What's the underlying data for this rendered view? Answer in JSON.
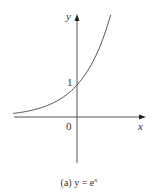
{
  "chart_data": {
    "type": "line",
    "function": "y = e^x",
    "xlabel": "x",
    "ylabel": "y",
    "annotations": [
      {
        "text": "1",
        "x": 0,
        "y": 1,
        "note": "y-intercept"
      },
      {
        "text": "0",
        "x": 0,
        "y": 0,
        "note": "origin"
      }
    ],
    "x": [
      -2.2,
      -2.0,
      -1.5,
      -1.0,
      -0.5,
      0,
      0.5,
      1.0,
      1.16
    ],
    "series": [
      {
        "name": "y = e^x",
        "values": [
          0.11,
          0.14,
          0.22,
          0.37,
          0.61,
          1.0,
          1.65,
          2.72,
          3.2
        ]
      }
    ],
    "xlim": [
      -2.2,
      2.3
    ],
    "ylim": [
      -1.4,
      3.2
    ],
    "grid": false,
    "legend": "none"
  },
  "labels": {
    "y_axis": "y",
    "x_axis": "x",
    "tick_one": "1",
    "origin": "0"
  },
  "caption": {
    "prefix": "(a) y = e",
    "exponent": "x"
  },
  "colors": {
    "axis": "#444444",
    "curve": "#555555",
    "text": "#333333"
  }
}
